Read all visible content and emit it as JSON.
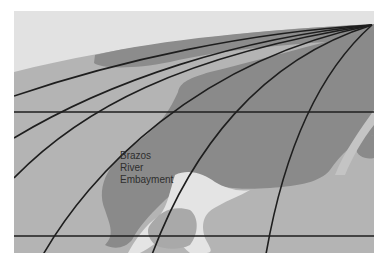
{
  "map": {
    "title": "",
    "region_label": {
      "lines": [
        "Brazos",
        "River",
        "Embayment"
      ]
    },
    "colors": {
      "sky": "#e2e2e2",
      "shelf_light": "#c4c4c4",
      "basin_medium": "#a9a9a9",
      "embayment_dark": "#8a8a8a",
      "deep_dark": "#7c7c7c",
      "highlight_white": "#ececec",
      "grid_line": "#1e1e1e"
    },
    "grid": {
      "horizontal_lines_y": [
        112,
        236
      ],
      "convergence_point": [
        372,
        25
      ],
      "curved_meridians": 6
    }
  }
}
